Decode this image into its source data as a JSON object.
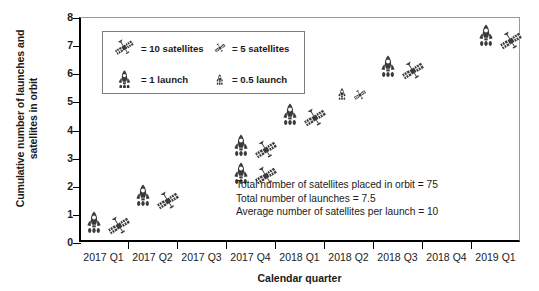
{
  "chart_data": {
    "type": "scatter",
    "title": "",
    "xlabel": "Calendar quarter",
    "ylabel": "Cumulative number of launches and satellites in orbit",
    "ylim": [
      0,
      8
    ],
    "yticks": [
      0,
      1,
      2,
      3,
      4,
      5,
      6,
      7,
      8
    ],
    "grid": false,
    "legend_position": "upper-left inside plot",
    "categories": [
      "2017 Q1",
      "2017 Q2",
      "2017 Q3",
      "2017 Q4",
      "2018 Q1",
      "2018 Q2",
      "2018 Q3",
      "2018 Q4",
      "2019 Q1"
    ],
    "series": [
      {
        "name": "Cumulative launches",
        "icon": "rocket",
        "values": [
          0.75,
          1.7,
          null,
          3.5,
          4.6,
          5.3,
          6.3,
          null,
          7.4
        ],
        "icon_sizes": [
          "full",
          "full",
          null,
          "full",
          "full",
          "half",
          "full",
          null,
          "full"
        ]
      },
      {
        "name": "Cumulative satellites in orbit",
        "icon": "satellite",
        "values": [
          0.6,
          1.5,
          null,
          3.3,
          4.45,
          5.25,
          6.1,
          null,
          7.2
        ],
        "icon_sizes": [
          "full",
          "full",
          null,
          "full",
          "full",
          "half",
          "full",
          null,
          "full"
        ]
      },
      {
        "name": "Cumulative launches (second marker)",
        "icon": "rocket",
        "values": [
          null,
          null,
          null,
          2.5,
          null,
          null,
          null,
          null,
          null
        ],
        "icon_sizes": [
          null,
          null,
          null,
          "full",
          null,
          null,
          null,
          null,
          null
        ]
      },
      {
        "name": "Cumulative satellites in orbit (second marker)",
        "icon": "satellite",
        "values": [
          null,
          null,
          null,
          2.4,
          null,
          null,
          null,
          null,
          null
        ],
        "icon_sizes": [
          null,
          null,
          null,
          "full",
          null,
          null,
          null,
          null,
          null
        ]
      }
    ]
  },
  "legend": {
    "entries": [
      {
        "icon": "satellite-large",
        "label": "= 10 satellites"
      },
      {
        "icon": "satellite-small",
        "label": "= 5 satellites"
      },
      {
        "icon": "rocket-large",
        "label": "= 1 launch"
      },
      {
        "icon": "rocket-small",
        "label": "= 0.5 launch"
      }
    ]
  },
  "annotation": {
    "lines": [
      "Total number of satellites placed in orbit = 75",
      "Total number of launches = 7.5",
      "Average number of satellites per launch = 10"
    ]
  },
  "axes": {
    "y_title": "Cumulative number of launches and satellites in orbit",
    "x_title": "Calendar quarter",
    "y_tick_labels": [
      "0",
      "1",
      "2",
      "3",
      "4",
      "5",
      "6",
      "7",
      "8"
    ],
    "x_tick_labels": [
      "2017 Q1",
      "2017 Q2",
      "2017 Q3",
      "2017 Q4",
      "2018 Q1",
      "2018 Q2",
      "2018 Q3",
      "2018 Q4",
      "2019 Q1"
    ]
  },
  "colors": {
    "icon": "#3a3a3a",
    "axis": "#000000",
    "frame": "#9a9a9a",
    "text": "#1a1a1a"
  }
}
